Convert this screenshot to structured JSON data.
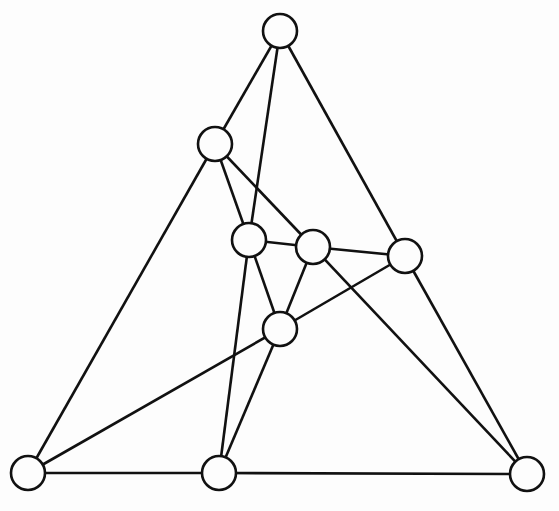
{
  "graph": {
    "node_radius": 17,
    "colors": {
      "stroke": "#111111",
      "fill": "#fdfdfd",
      "background": "#fdfdfd"
    },
    "nodes": [
      {
        "id": "top",
        "x": 280,
        "y": 31
      },
      {
        "id": "a",
        "x": 215,
        "y": 144
      },
      {
        "id": "b",
        "x": 249,
        "y": 240
      },
      {
        "id": "c",
        "x": 313,
        "y": 247
      },
      {
        "id": "d",
        "x": 405,
        "y": 256
      },
      {
        "id": "e",
        "x": 280,
        "y": 329
      },
      {
        "id": "bl",
        "x": 28,
        "y": 473
      },
      {
        "id": "bm",
        "x": 219,
        "y": 473
      },
      {
        "id": "br",
        "x": 527,
        "y": 474
      }
    ],
    "edges": [
      [
        "top",
        "a"
      ],
      [
        "top",
        "b"
      ],
      [
        "top",
        "d"
      ],
      [
        "a",
        "bl"
      ],
      [
        "a",
        "b"
      ],
      [
        "a",
        "c"
      ],
      [
        "b",
        "c"
      ],
      [
        "b",
        "e"
      ],
      [
        "b",
        "bm"
      ],
      [
        "c",
        "d"
      ],
      [
        "c",
        "e"
      ],
      [
        "c",
        "br"
      ],
      [
        "d",
        "e"
      ],
      [
        "d",
        "br"
      ],
      [
        "e",
        "bl"
      ],
      [
        "e",
        "bm"
      ],
      [
        "bl",
        "bm"
      ],
      [
        "bm",
        "br"
      ]
    ]
  }
}
